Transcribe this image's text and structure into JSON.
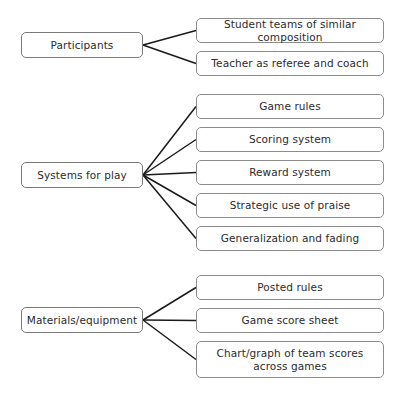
{
  "diagram": {
    "type": "hierarchy-tree",
    "orientation": "left-to-right",
    "style": {
      "box_border_color": "#8c8c8c",
      "box_fill_color": "#ffffff",
      "connector_color": "#1a1a1a",
      "text_color": "#2b2b2b",
      "background_color": "#ffffff"
    },
    "groups": [
      {
        "id": "participants",
        "parent": {
          "label": "Participants",
          "x": 21,
          "y": 32,
          "w": 122,
          "h": 26
        },
        "junction": {
          "x": 143,
          "y": 45
        },
        "children": [
          {
            "label": "Student teams of similar composition",
            "x": 196,
            "y": 18,
            "w": 188,
            "h": 25
          },
          {
            "label": "Teacher as referee and coach",
            "x": 196,
            "y": 51,
            "w": 188,
            "h": 25
          }
        ]
      },
      {
        "id": "systems-for-play",
        "parent": {
          "label": "Systems for play",
          "x": 21,
          "y": 162,
          "w": 122,
          "h": 26
        },
        "junction": {
          "x": 143,
          "y": 175
        },
        "children": [
          {
            "label": "Game rules",
            "x": 196,
            "y": 94,
            "w": 188,
            "h": 25
          },
          {
            "label": "Scoring system",
            "x": 196,
            "y": 127,
            "w": 188,
            "h": 25
          },
          {
            "label": "Reward system",
            "x": 196,
            "y": 160,
            "w": 188,
            "h": 25
          },
          {
            "label": "Strategic use of praise",
            "x": 196,
            "y": 193,
            "w": 188,
            "h": 25
          },
          {
            "label": "Generalization and fading",
            "x": 196,
            "y": 226,
            "w": 188,
            "h": 25
          }
        ]
      },
      {
        "id": "materials-equipment",
        "parent": {
          "label": "Materials/equipment",
          "x": 21,
          "y": 307,
          "w": 122,
          "h": 26
        },
        "junction": {
          "x": 143,
          "y": 320
        },
        "children": [
          {
            "label": "Posted rules",
            "x": 196,
            "y": 275,
            "w": 188,
            "h": 25
          },
          {
            "label": "Game score sheet",
            "x": 196,
            "y": 308,
            "w": 188,
            "h": 25
          },
          {
            "label": "Chart/graph of team scores across games",
            "x": 196,
            "y": 341,
            "w": 188,
            "h": 37
          }
        ]
      }
    ]
  }
}
